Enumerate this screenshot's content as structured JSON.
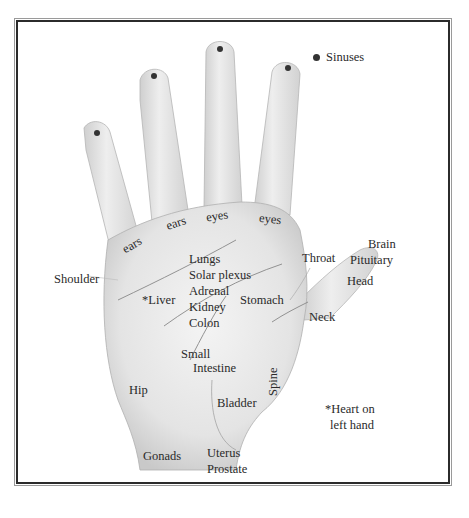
{
  "diagram": {
    "legend": {
      "marker": "dot",
      "label": "Sinuses"
    },
    "labels": {
      "ears_1": "ears",
      "ears_2": "ears",
      "eyes_1": "eyes",
      "eyes_2": "eyes",
      "shoulder": "Shoulder",
      "lungs": "Lungs",
      "solar_plexus": "Solar plexus",
      "adrenal": "Adrenal",
      "kidney": "Kidney",
      "colon": "Colon",
      "liver": "*Liver",
      "stomach": "Stomach",
      "throat": "Throat",
      "brain": "Brain",
      "pituitary": "Pituitary",
      "head": "Head",
      "neck": "Neck",
      "small": "Small",
      "intestine": "Intestine",
      "hip": "Hip",
      "spine": "Spine",
      "bladder": "Bladder",
      "gonads": "Gonads",
      "uterus": "Uterus",
      "prostate": "Prostate",
      "heart_note_1": "*Heart on",
      "heart_note_2": "left hand"
    },
    "colors": {
      "skin": "#e9e9e9",
      "shade": "#c8c8c8",
      "outline": "#9a9a9a",
      "text": "#2a2a2a",
      "frame": "#2b2b2b"
    }
  }
}
